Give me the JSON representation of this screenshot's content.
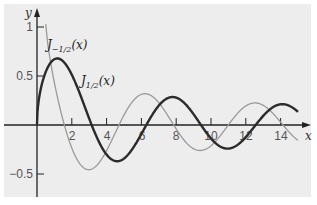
{
  "chart_data": {
    "type": "line",
    "title": "",
    "xlabel": "x",
    "ylabel": "y",
    "xlim": [
      0,
      15.5
    ],
    "ylim": [
      -0.7,
      1.1
    ],
    "grid": false,
    "x_ticks": [
      2,
      4,
      6,
      8,
      10,
      12,
      14
    ],
    "x_tick_labels": [
      "2",
      "4",
      "6",
      "8",
      "10",
      "12",
      "14"
    ],
    "y_ticks": [
      1,
      0.5,
      -0.5
    ],
    "y_tick_labels": [
      "1",
      "0.5",
      "−0.5"
    ],
    "series": [
      {
        "name": "J_{1/2}(x)",
        "style": "thick dark",
        "color": "#2b2b2b",
        "formula": "sqrt(2/(pi x)) sin x",
        "x": [
          0,
          1,
          1.57,
          2,
          3,
          3.14,
          4,
          4.71,
          5,
          6,
          7,
          7.85,
          8,
          9,
          10,
          11,
          12,
          13,
          14,
          15
        ],
        "values": [
          0,
          0.67,
          0.64,
          0.51,
          0.07,
          0,
          -0.3,
          -0.37,
          -0.34,
          -0.09,
          0.2,
          0.28,
          0.28,
          0.11,
          -0.14,
          -0.24,
          -0.12,
          0.09,
          0.21,
          0.13
        ]
      },
      {
        "name": "J_{-1/2}(x)",
        "style": "thin gray",
        "color": "#9a9a9a",
        "formula": "sqrt(2/(pi x)) cos x",
        "x": [
          0.3,
          0.5,
          1,
          1.57,
          2,
          3,
          3.14,
          4,
          4.71,
          5,
          6,
          6.28,
          7,
          8,
          9,
          9.42,
          10,
          11,
          12,
          12.57,
          13,
          14,
          14.9
        ],
        "values": [
          1.39,
          0.99,
          0.43,
          0,
          -0.23,
          -0.45,
          -0.45,
          -0.26,
          0,
          0.1,
          0.31,
          0.32,
          0.23,
          -0.04,
          -0.24,
          -0.26,
          -0.21,
          0.0,
          0.2,
          0.23,
          0.2,
          0.03,
          -0.14
        ]
      }
    ],
    "annotations": [
      {
        "text": "J_{-1/2}(x)",
        "near_x": 1.2,
        "near_y": 0.9
      },
      {
        "text": "J_{1/2}(x)",
        "near_x": 2.6,
        "near_y": 0.45
      }
    ],
    "legend": "inline labels (no legend box)"
  },
  "labels": {
    "y_axis": "y",
    "x_axis": "x",
    "curve_neg_main": "J",
    "curve_neg_sub": "−1/2",
    "curve_neg_arg": "(x)",
    "curve_pos_main": "J",
    "curve_pos_sub": "1/2",
    "curve_pos_arg": "(x)",
    "ytick_1": "1",
    "ytick_05": "0.5",
    "ytick_m05": "−0.5",
    "xtick_2": "2",
    "xtick_4": "4",
    "xtick_6": "6",
    "xtick_8": "8",
    "xtick_10": "10",
    "xtick_12": "12",
    "xtick_14": "14"
  }
}
